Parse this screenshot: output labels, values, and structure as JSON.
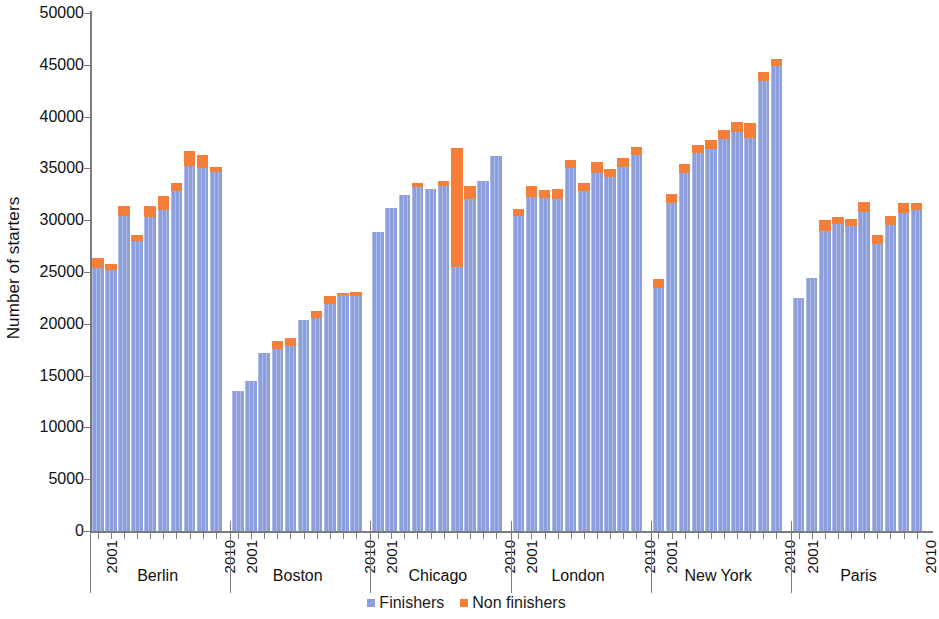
{
  "chart_data": {
    "type": "bar",
    "title": "",
    "subtitle": "",
    "xlabel": "",
    "ylabel": "Number of starters",
    "ylim": [
      0,
      50000
    ],
    "ytick_step": 5000,
    "yticks": [
      0,
      5000,
      10000,
      15000,
      20000,
      25000,
      30000,
      35000,
      40000,
      45000,
      50000
    ],
    "ytick_labels": [
      "0",
      "5000",
      "10000",
      "15000",
      "20000",
      "25000",
      "30000",
      "35000",
      "40000",
      "45000",
      "50000"
    ],
    "grid": false,
    "stacked": true,
    "legend_position": "bottom-center",
    "legend": [
      "Finishers",
      "Non finishers"
    ],
    "colors": {
      "finishers": "#8c9fdc",
      "nonfinishers": "#f57f39",
      "axis": "#7b7b7b",
      "text": "#111111"
    },
    "x_group_label_first": "2001",
    "x_group_label_last": "2010",
    "categories": [
      "2001",
      "2002",
      "2003",
      "2004",
      "2005",
      "2006",
      "2007",
      "2008",
      "2009",
      "2010"
    ],
    "groups": [
      {
        "name": "Berlin",
        "first_year": "2001",
        "last_year": "2010",
        "series": [
          {
            "name": "Finishers",
            "values": [
              25400,
              25200,
              30400,
              28000,
              30300,
              31000,
              32800,
              35200,
              35000,
              34700
            ]
          },
          {
            "name": "Non finishers",
            "values": [
              1000,
              600,
              1000,
              600,
              1100,
              1300,
              800,
              1500,
              1300,
              400
            ]
          }
        ],
        "totals": [
          26400,
          25800,
          31400,
          28600,
          31400,
          32300,
          33600,
          36700,
          36300,
          35100
        ]
      },
      {
        "name": "Boston",
        "first_year": "2001",
        "last_year": "2010",
        "series": [
          {
            "name": "Finishers",
            "values": [
              13500,
              14500,
              17200,
              17600,
              17900,
              20400,
              20600,
              21900,
              22800,
              22700
            ]
          },
          {
            "name": "Non finishers",
            "values": [
              0,
              0,
              0,
              700,
              700,
              0,
              600,
              800,
              200,
              400
            ]
          }
        ],
        "totals": [
          13500,
          14500,
          17200,
          18300,
          18600,
          20400,
          21200,
          22700,
          23000,
          23100
        ]
      },
      {
        "name": "Chicago",
        "first_year": "2001",
        "last_year": "2010",
        "series": [
          {
            "name": "Finishers",
            "values": [
              28900,
              31200,
              32400,
              33200,
              33000,
              33300,
              25500,
              32000,
              33800,
              36200
            ]
          },
          {
            "name": "Non finishers",
            "values": [
              0,
              0,
              0,
              400,
              0,
              500,
              11500,
              1300,
              0,
              0
            ]
          }
        ],
        "totals": [
          28900,
          31200,
          32400,
          33600,
          33000,
          33800,
          37000,
          33300,
          33800,
          36200
        ]
      },
      {
        "name": "London",
        "first_year": "2001",
        "last_year": "2010",
        "series": [
          {
            "name": "Finishers",
            "values": [
              30400,
              32200,
              32100,
              32000,
              35000,
              32800,
              34600,
              34200,
              35100,
              36300
            ]
          },
          {
            "name": "Non finishers",
            "values": [
              700,
              1100,
              800,
              1000,
              800,
              800,
              1000,
              700,
              900,
              800
            ]
          }
        ],
        "totals": [
          31100,
          33300,
          32900,
          33000,
          35800,
          33600,
          35600,
          34900,
          36000,
          37100
        ]
      },
      {
        "name": "New York",
        "first_year": "2001",
        "last_year": "2010",
        "series": [
          {
            "name": "Finishers",
            "values": [
              23500,
              31700,
              34600,
              36500,
              36900,
              37800,
              38500,
              37900,
              43400,
              44900
            ]
          },
          {
            "name": "Non finishers",
            "values": [
              800,
              800,
              800,
              800,
              800,
              900,
              1000,
              1500,
              900,
              700
            ]
          }
        ],
        "totals": [
          24300,
          32500,
          35400,
          37300,
          37700,
          38700,
          39500,
          39400,
          44300,
          45600
        ]
      },
      {
        "name": "Paris",
        "first_year": "2001",
        "last_year": "2010",
        "series": [
          {
            "name": "Finishers",
            "values": [
              22500,
              24400,
              29000,
              29600,
              29400,
              30800,
              27700,
              29500,
              30700,
              31000
            ]
          },
          {
            "name": "Non finishers",
            "values": [
              0,
              0,
              1000,
              700,
              700,
              1000,
              900,
              900,
              1000,
              700
            ]
          }
        ],
        "totals": [
          22500,
          24400,
          30000,
          30300,
          30100,
          31800,
          28600,
          30400,
          31700,
          31700
        ]
      }
    ]
  },
  "axes": {
    "y_title": "Number of starters"
  },
  "legend": {
    "items": [
      {
        "label": "Finishers",
        "swatch": "finishers-swatch-icon",
        "color": "#8c9fdc"
      },
      {
        "label": "Non finishers",
        "swatch": "nonfinishers-swatch-icon",
        "color": "#f57f39"
      }
    ]
  }
}
